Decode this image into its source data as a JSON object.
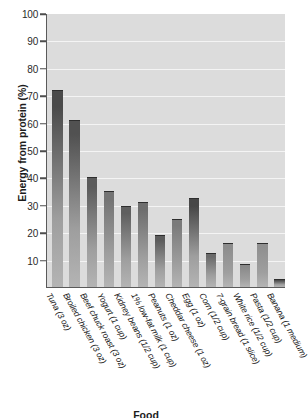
{
  "chart": {
    "title": "Figure: Energy from protein",
    "ylabel": "Energy from protein (%)",
    "xlabel": "Food"
  },
  "yticks": [
    "100",
    "90",
    "80",
    "70",
    "60",
    "50",
    "40",
    "30",
    "20",
    "10"
  ],
  "labels": [
    "Tuna (3 oz)",
    "Broiled chicken (3 oz)",
    "Beef chuck roast (3 oz)",
    "Yogurt (1 cup)",
    "Kidney beans (1/2 cup)",
    "1% low-fat milk (1 cup)",
    "Peanuts (1 oz)",
    "Cheddar cheese (1 oz)",
    "Egg (1 oz)",
    "Corn (1/2 cup)",
    "7-grain bread (1 slice)",
    "White rice (1/2 cup)",
    "Pasta (1/2 cup)",
    "Banana (1 medium)"
  ],
  "chart_data": {
    "type": "bar",
    "title": "Energy from protein",
    "xlabel": "Food",
    "ylabel": "Energy from protein (%)",
    "ylim": [
      0,
      100
    ],
    "ytick_step": 10,
    "grid": true,
    "legend": "none",
    "categories": [
      "Tuna (3 oz)",
      "Broiled chicken (3 oz)",
      "Beef chuck roast (3 oz)",
      "Yogurt (1 cup)",
      "Kidney beans (1/2 cup)",
      "1% low-fat milk (1 cup)",
      "Peanuts (1 oz)",
      "Cheddar cheese (1 oz)",
      "Egg (1 oz)",
      "Corn (1/2 cup)",
      "7-grain bread (1 slice)",
      "White rice (1/2 cup)",
      "Pasta (1/2 cup)",
      "Banana (1 medium)"
    ],
    "values": [
      72,
      61,
      40,
      35,
      29.5,
      31,
      19,
      25,
      32.5,
      12.5,
      16,
      8.5,
      16,
      3
    ],
    "bar_colors": [
      "#4a4a4a",
      "#515151",
      "#5b5b5b",
      "#747474",
      "#5f5f5f",
      "#6e6e6e",
      "#5c5c5c",
      "#7b7b7b",
      "#474747",
      "#6a6a6a",
      "#8d8d8d",
      "#8a8a8a",
      "#909090",
      "#4e4e4e"
    ],
    "plot_background": "#dcdcdc",
    "gridline_color": "#f4f4f4",
    "axis_color": "#5a5a5a"
  }
}
